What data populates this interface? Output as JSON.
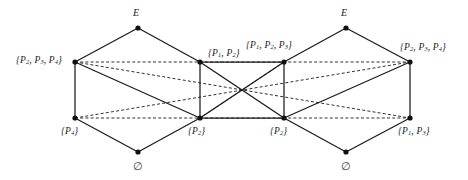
{
  "figure": {
    "background_color": "#ffffff",
    "line_color": "#1b1b1b",
    "node_color": "#111111"
  },
  "diagrams": [
    {
      "id": "left-lattice",
      "nodes": [
        {
          "id": "L-top",
          "label_html": "E",
          "label_plain": "E",
          "x": 138,
          "y": 28,
          "label_x": 133,
          "label_y": 8,
          "anchor": "left"
        },
        {
          "id": "L-upleft",
          "label_html": "{<i>P</i><sub>2</sub>, <i>P</i><sub>3</sub>, <i>P</i><sub>4</sub>}",
          "label_plain": "{P2, P3, P4}",
          "x": 75,
          "y": 62,
          "label_x": 16,
          "label_y": 56,
          "anchor": "right"
        },
        {
          "id": "L-upright",
          "label_html": "{<i>P</i><sub>1</sub>, <i>P</i><sub>2</sub>}",
          "label_plain": "{P1, P2}",
          "x": 200,
          "y": 62,
          "label_x": 208,
          "label_y": 49,
          "anchor": "left"
        },
        {
          "id": "L-loleft",
          "label_html": "{<i>P</i><sub>4</sub>}",
          "label_plain": "{P4}",
          "x": 75,
          "y": 118,
          "label_x": 61,
          "label_y": 127,
          "anchor": "left"
        },
        {
          "id": "L-loright",
          "label_html": "{<i>P</i><sub>2</sub>}",
          "label_plain": "{P2}",
          "x": 200,
          "y": 118,
          "label_x": 188,
          "label_y": 127,
          "anchor": "left"
        },
        {
          "id": "L-bottom",
          "label_html": "&#8709;",
          "label_plain": "empty set",
          "x": 138,
          "y": 152,
          "label_x": 133,
          "label_y": 161,
          "anchor": "left"
        }
      ],
      "solid_edges": [
        [
          "L-top",
          "L-upleft"
        ],
        [
          "L-top",
          "L-upright"
        ],
        [
          "L-upleft",
          "L-loleft"
        ],
        [
          "L-upright",
          "L-loright"
        ],
        [
          "L-loleft",
          "L-bottom"
        ],
        [
          "L-loright",
          "L-bottom"
        ],
        [
          "L-upleft",
          "L-loright"
        ]
      ]
    },
    {
      "id": "right-lattice",
      "nodes": [
        {
          "id": "R-top",
          "label_html": "E",
          "label_plain": "E",
          "x": 346,
          "y": 28,
          "label_x": 341,
          "label_y": 8,
          "anchor": "left"
        },
        {
          "id": "R-upleft",
          "label_html": "{<i>P</i><sub>1</sub>, <i>P</i><sub>2</sub>, <i>P</i><sub>3</sub>}",
          "label_plain": "{P1, P2, P3}",
          "x": 284,
          "y": 62,
          "label_x": 246,
          "label_y": 41,
          "anchor": "left"
        },
        {
          "id": "R-upright",
          "label_html": "{<i>P</i><sub>2</sub>, <i>P</i><sub>3</sub>, <i>P</i><sub>4</sub>}",
          "label_plain": "{P2, P3, P4}",
          "x": 410,
          "y": 62,
          "label_x": 400,
          "label_y": 43,
          "anchor": "left"
        },
        {
          "id": "R-loleft",
          "label_html": "{<i>P</i><sub>2</sub>}",
          "label_plain": "{P2}",
          "x": 284,
          "y": 118,
          "label_x": 270,
          "label_y": 127,
          "anchor": "left"
        },
        {
          "id": "R-loright",
          "label_html": "{<i>P</i><sub>1</sub>, <i>P</i><sub>3</sub>}",
          "label_plain": "{P1, P3}",
          "x": 410,
          "y": 118,
          "label_x": 398,
          "label_y": 127,
          "anchor": "left"
        },
        {
          "id": "R-bottom",
          "label_html": "&#8709;",
          "label_plain": "empty set",
          "x": 346,
          "y": 152,
          "label_x": 341,
          "label_y": 161,
          "anchor": "left"
        }
      ],
      "solid_edges": [
        [
          "R-top",
          "R-upleft"
        ],
        [
          "R-top",
          "R-upright"
        ],
        [
          "R-upleft",
          "R-loleft"
        ],
        [
          "R-upright",
          "R-loright"
        ],
        [
          "R-loleft",
          "R-bottom"
        ],
        [
          "R-loright",
          "R-bottom"
        ],
        [
          "R-upright",
          "R-loleft"
        ]
      ]
    }
  ],
  "cross_links": {
    "note": "dashed and solid lines connecting the two lattices through a common crossing point",
    "dashed_edges": [
      [
        "L-upleft",
        "R-loright"
      ],
      [
        "L-upleft",
        "R-upright"
      ],
      [
        "L-loleft",
        "R-upright"
      ],
      [
        "R-upleft",
        "L-loright"
      ],
      [
        "L-loleft",
        "R-loright"
      ]
    ],
    "solid_edges": [
      [
        "L-upright",
        "R-loleft"
      ],
      [
        "L-loright",
        "R-upleft"
      ],
      [
        "L-upright",
        "R-upleft"
      ],
      [
        "L-loright",
        "R-loleft"
      ]
    ]
  }
}
